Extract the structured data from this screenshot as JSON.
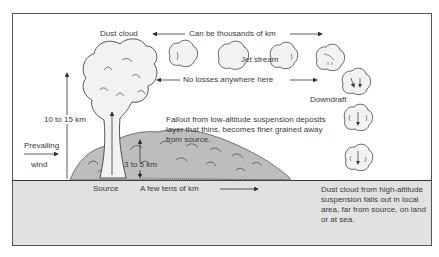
{
  "diagram": {
    "title_labels": {
      "dust_cloud": "Dust cloud",
      "distance_span": "Can be thousands of km",
      "jet_stream": "Jet stream",
      "no_losses": "No losses anywhere here",
      "downdraft": "Downdraft",
      "height_high": "10 to 15 km",
      "height_low": "3 to 5 km",
      "prevailing_wind_line1": "Prevailing",
      "prevailing_wind_line2": "wind",
      "source": "Source",
      "few_tens_km": "A few tens of km"
    },
    "notes": {
      "low_altitude_fallout": "Fallout from low-altitude suspension deposits layer that thins, becomes finer grained away from source.",
      "high_altitude_fallout": "Dust cloud from high-altitude suspension falls out in local area, far from source, on land or at sea."
    },
    "colors": {
      "ground_fill": "#e1e1e1",
      "cloud_fill": "#f2f2f2",
      "mound_fill": "#bdbdbd",
      "line": "#333333",
      "text": "#3a3a3a"
    },
    "clouds": [
      {
        "name": "cloud-1",
        "cx": 183,
        "cy": 54
      },
      {
        "name": "cloud-2-jet-stream",
        "cx": 233,
        "cy": 56
      },
      {
        "name": "cloud-3",
        "cx": 283,
        "cy": 56
      },
      {
        "name": "cloud-4",
        "cx": 330,
        "cy": 58
      },
      {
        "name": "cloud-5",
        "cx": 356,
        "cy": 82
      },
      {
        "name": "cloud-6",
        "cx": 358,
        "cy": 118
      },
      {
        "name": "cloud-7",
        "cx": 358,
        "cy": 158
      }
    ]
  }
}
